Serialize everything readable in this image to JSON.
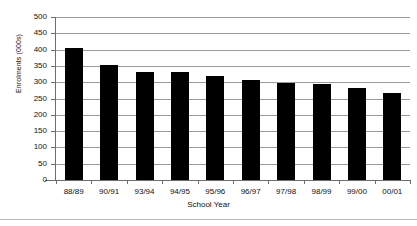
{
  "chart_data": {
    "type": "bar",
    "title": "",
    "xlabel": "School Year",
    "ylabel": "Enrolments (000s)",
    "categories": [
      "88/89",
      "90/91",
      "93/94",
      "94/95",
      "95/96",
      "96/97",
      "97/98",
      "98/99",
      "99/00",
      "00/01"
    ],
    "values": [
      405,
      352,
      330,
      330,
      320,
      307,
      298,
      293,
      281,
      268
    ],
    "series": [
      {
        "name": "Enrolments",
        "values": [
          405,
          352,
          330,
          330,
          320,
          307,
          298,
          293,
          281,
          268
        ],
        "color": "#000000"
      }
    ],
    "ylim": [
      0,
      500
    ],
    "ytick_labels": [
      "500",
      "450",
      "400",
      "350",
      "300",
      "250",
      "200",
      "150",
      "100",
      "50",
      "0"
    ],
    "ytick_values": [
      500,
      450,
      400,
      350,
      300,
      250,
      200,
      150,
      100,
      50,
      0
    ],
    "ytick_interval": 50,
    "grid": true,
    "grid_axis": "y",
    "grid_color": "#9a9a9a",
    "legend": false,
    "legend_position": "none",
    "bar_color": "#000000",
    "plot_background": "#ffffff"
  }
}
